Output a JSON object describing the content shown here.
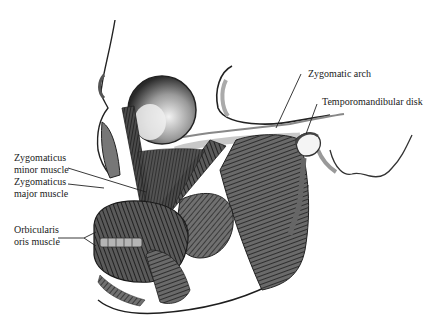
{
  "figure": {
    "labels": [
      {
        "id": "zygomatic-arch",
        "lines": [
          "Zygomatic arch"
        ]
      },
      {
        "id": "temporomandibular-disk",
        "lines": [
          "Temporomandibular disk"
        ]
      },
      {
        "id": "zygomaticus-minor",
        "lines": [
          "Zygomaticus",
          "minor muscle"
        ]
      },
      {
        "id": "zygomaticus-major",
        "lines": [
          "Zygomaticus",
          "major muscle"
        ]
      },
      {
        "id": "orbicularis-oris",
        "lines": [
          "Orbicularis",
          "oris muscle"
        ]
      }
    ]
  },
  "colors": {
    "background": "#ffffff",
    "ink": "#1a1a1a",
    "muscle_dark": "#2b2b2b",
    "muscle_mid": "#555555",
    "bone_shade": "#bdbdbd"
  }
}
